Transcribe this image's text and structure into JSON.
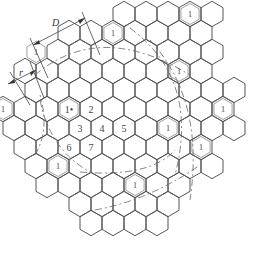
{
  "diagram": {
    "hex": {
      "radius": 12.7,
      "col_spacing": 22,
      "row_spacing": 19,
      "center": [
        102,
        128
      ]
    },
    "rows": [
      {
        "r": -6,
        "cols": [
          1,
          2,
          3,
          4,
          5
        ]
      },
      {
        "r": -5,
        "cols": [
          -1,
          0,
          1,
          2,
          3,
          4,
          5
        ]
      },
      {
        "r": -4,
        "cols": [
          -2,
          -1,
          0,
          1,
          2,
          3,
          4,
          5
        ]
      },
      {
        "r": -3,
        "cols": [
          -3,
          -2,
          -1,
          0,
          1,
          2,
          3,
          4,
          5
        ]
      },
      {
        "r": -2,
        "cols": [
          -3,
          -2,
          -1,
          0,
          1,
          2,
          3,
          4,
          5,
          6
        ]
      },
      {
        "r": -1,
        "cols": [
          -4,
          -3,
          -2,
          -1,
          0,
          1,
          2,
          3,
          4,
          5,
          6
        ]
      },
      {
        "r": 0,
        "cols": [
          -4,
          -3,
          -2,
          -1,
          0,
          1,
          2,
          3,
          4,
          5,
          6
        ]
      },
      {
        "r": 1,
        "cols": [
          -3,
          -2,
          -1,
          0,
          1,
          2,
          3,
          4,
          5
        ]
      },
      {
        "r": 2,
        "cols": [
          -3,
          -2,
          -1,
          0,
          1,
          2,
          3,
          4,
          5
        ]
      },
      {
        "r": 3,
        "cols": [
          -2,
          -1,
          0,
          1,
          2,
          3,
          4
        ]
      },
      {
        "r": 4,
        "cols": [
          -1,
          0,
          1,
          2,
          3
        ]
      },
      {
        "r": 5,
        "cols": [
          0,
          1,
          2,
          3
        ]
      }
    ],
    "numbered_cells": [
      {
        "label": "1•",
        "r": -1,
        "c": -1
      },
      {
        "label": "2",
        "r": -1,
        "c": 0
      },
      {
        "label": "3",
        "r": 0,
        "c": -1
      },
      {
        "label": "4",
        "r": 0,
        "c": 0
      },
      {
        "label": "5",
        "r": 0,
        "c": 1
      },
      {
        "label": "6",
        "r": 1,
        "c": -1
      },
      {
        "label": "7",
        "r": 1,
        "c": 0
      }
    ],
    "cochannel_cells": [
      {
        "label": "1",
        "r": -5,
        "c": 1
      },
      {
        "label": "1",
        "r": -6,
        "c": 4
      },
      {
        "label": "1",
        "r": -3,
        "c": 4
      },
      {
        "label": "1",
        "r": -1,
        "c": 6
      },
      {
        "label": "1",
        "r": -4,
        "c": -3
      },
      {
        "label": "1",
        "r": -1,
        "c": -4
      },
      {
        "label": "1",
        "r": 2,
        "c": -2
      },
      {
        "label": "1",
        "r": 0,
        "c": 3
      },
      {
        "label": "1",
        "r": 3,
        "c": 2
      },
      {
        "label": "1",
        "r": 1,
        "c": 5
      }
    ],
    "dimensions": [
      {
        "label": "D"
      },
      {
        "label": "r"
      }
    ]
  }
}
